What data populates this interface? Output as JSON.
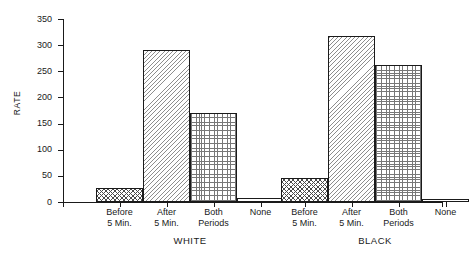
{
  "chart_data": {
    "type": "bar",
    "title": "",
    "xlabel": "",
    "ylabel": "RATE",
    "ylim": [
      0,
      350
    ],
    "yticks": [
      0,
      50,
      100,
      150,
      200,
      250,
      300,
      350
    ],
    "ytick_labels": [
      "0",
      "50",
      "100",
      "150",
      "200",
      "250",
      "300",
      "350"
    ],
    "grid": false,
    "legend": "none",
    "categories": [
      "Before 5 Min.",
      "After 5 Min.",
      "Both Periods",
      "None"
    ],
    "groups": [
      "WHITE",
      "BLACK"
    ],
    "series": [
      {
        "name": "WHITE",
        "values": [
          27,
          290,
          170,
          7
        ]
      },
      {
        "name": "BLACK",
        "values": [
          45,
          317,
          263,
          6
        ]
      }
    ],
    "bar_patterns": [
      "crosshatch",
      "diagonal-hatch",
      "dot-grid",
      "plain"
    ],
    "colors": {
      "axis": "#1a1a1a",
      "bar_outline": "#1a1a1a",
      "bar_fill": "#ffffff",
      "hatch": "#7a7a7a",
      "background": "#ffffff"
    }
  },
  "axis": {
    "y_title": "RATE",
    "ticks": [
      {
        "label": "350",
        "value": 350
      },
      {
        "label": "300",
        "value": 300
      },
      {
        "label": "250",
        "value": 250
      },
      {
        "label": "200",
        "value": 200
      },
      {
        "label": "150",
        "value": 150
      },
      {
        "label": "100",
        "value": 100
      },
      {
        "label": "50",
        "value": 50
      },
      {
        "label": "0",
        "value": 0
      }
    ]
  },
  "x_labels": [
    {
      "line1": "Before",
      "line2": "5 Min."
    },
    {
      "line1": "After",
      "line2": "5 Min."
    },
    {
      "line1": "Both",
      "line2": "Periods"
    },
    {
      "line1": "None",
      "line2": ""
    },
    {
      "line1": "Before",
      "line2": "5 Min."
    },
    {
      "line1": "After",
      "line2": "5 Min."
    },
    {
      "line1": "Both",
      "line2": "Periods"
    },
    {
      "line1": "None",
      "line2": ""
    }
  ],
  "group_labels": [
    {
      "text": "WHITE"
    },
    {
      "text": "BLACK"
    }
  ],
  "title": {
    "text": ""
  }
}
